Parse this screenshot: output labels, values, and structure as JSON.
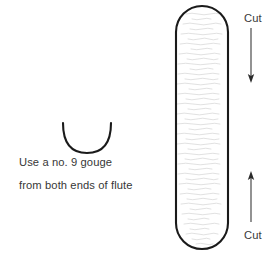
{
  "diagram": {
    "background_color": "#ffffff",
    "outline_color": "#1a1a1a",
    "grain_color": "#d8d8d8",
    "text_color": "#373737",
    "caption": {
      "line1": "Use a no. 9 gouge",
      "line2": "from both ends of flute"
    },
    "gouge": {
      "icon_name": "gouge-profile-arc",
      "shape": "u-arc",
      "left_x": 62,
      "right_x": 112,
      "top_y": 123,
      "bottom_y": 152
    },
    "flute": {
      "icon_name": "flute-blank-stadium",
      "shape": "stadium",
      "left_x": 175,
      "right_x": 229,
      "top_y": 5,
      "bottom_y": 250,
      "fill": "#ffffff",
      "texture": "wood-grain-horizontal-strokes"
    },
    "annotations": [
      {
        "label": "Cut",
        "name": "cut-annotation-top",
        "arrow_direction": "down",
        "arrow_x": 251,
        "arrow_start_y": 28,
        "arrow_end_y": 82
      },
      {
        "label": "Cut",
        "name": "cut-annotation-bottom",
        "arrow_direction": "up",
        "arrow_x": 251,
        "arrow_start_y": 222,
        "arrow_end_y": 172
      }
    ]
  }
}
